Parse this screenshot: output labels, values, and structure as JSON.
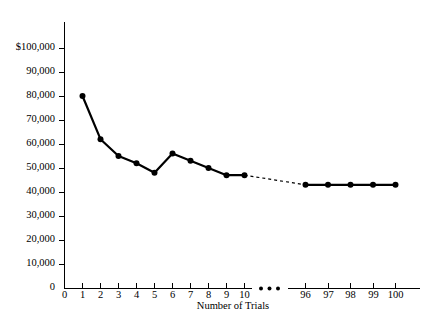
{
  "chart_data": {
    "type": "line",
    "title": "",
    "subtitle": "",
    "xlabel": "Number of Trials",
    "ylabel": "",
    "ylim": [
      0,
      100000
    ],
    "xlim_left": [
      0,
      10
    ],
    "xlim_right": [
      95.5,
      100.5
    ],
    "grid": false,
    "legend": null,
    "axis_break": true,
    "axis_break_symbol": "• • •",
    "y_ticks": [
      0,
      10000,
      20000,
      30000,
      40000,
      50000,
      60000,
      70000,
      80000,
      90000,
      100000
    ],
    "y_tick_labels": [
      "0",
      "10,000",
      "20,000",
      "30,000",
      "40,000",
      "50,000",
      "60,000",
      "70,000",
      "80,000",
      "90,000",
      "$100,000"
    ],
    "x_ticks_left": [
      0,
      1,
      2,
      3,
      4,
      5,
      6,
      7,
      8,
      9,
      10
    ],
    "x_tick_labels_left": [
      "0",
      "1",
      "2",
      "3",
      "4",
      "5",
      "6",
      "7",
      "8",
      "9",
      "10"
    ],
    "x_ticks_right": [
      96,
      97,
      98,
      99,
      100
    ],
    "x_tick_labels_right": [
      "96",
      "97",
      "98",
      "99",
      "100"
    ],
    "series": [
      {
        "name": "Cost per unit (early trials)",
        "x": [
          1,
          2,
          3,
          4,
          5,
          6,
          7,
          8,
          9,
          10
        ],
        "values": [
          80000,
          62000,
          55000,
          52000,
          48000,
          56000,
          53000,
          50000,
          47000,
          47000
        ],
        "style": "solid",
        "markers": true
      },
      {
        "name": "Cost per unit (late trials)",
        "x": [
          96,
          97,
          98,
          99,
          100
        ],
        "values": [
          43000,
          43000,
          43000,
          43000,
          43000
        ],
        "style": "solid",
        "markers": true
      },
      {
        "name": "Interpolated connector",
        "x": [
          10,
          96
        ],
        "values": [
          47000,
          43000
        ],
        "style": "dashed",
        "markers": false
      }
    ]
  },
  "axis": {
    "x_axis_title": "Number of Trials",
    "break_marker": "• • •"
  }
}
